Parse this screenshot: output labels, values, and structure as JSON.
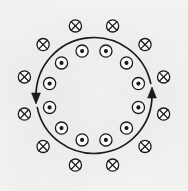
{
  "figure": {
    "title": "Circular current loop with magnetic field symbols",
    "width": 188,
    "height": 191,
    "background_color": "#fbfbfa",
    "ink_color": "#1a1a1a"
  },
  "loop": {
    "label": "current-loop",
    "center_x": 94,
    "center_y": 95.5,
    "radius": 58,
    "stroke_width": 1.7,
    "stroke_color": "#1a1a1a",
    "fill": "none",
    "direction": "counterclockwise",
    "gap_degrees": 6
  },
  "arrows": [
    {
      "name": "arrow-left-downward",
      "angle_degrees": 186,
      "points": "down",
      "tip_x": 36.0,
      "tip_y": 104.0,
      "size": 11
    },
    {
      "name": "arrow-right-upward",
      "angle_degrees": 6,
      "points": "up",
      "tip_x": 152.0,
      "tip_y": 87.0,
      "size": 11
    }
  ],
  "symbols": {
    "cross_symbol": {
      "glyph": "cross-in-circle",
      "meaning": "field into page",
      "count": 12,
      "orbit_radius": 72,
      "circle_radius": 6.1,
      "stroke_width": 1.3,
      "angle_offset_degrees": 15
    },
    "dot_symbol": {
      "glyph": "dot-in-circle",
      "meaning": "field out of page",
      "count": 12,
      "orbit_radius": 46,
      "circle_radius": 6.1,
      "inner_dot_radius": 2.05,
      "stroke_width": 1.3,
      "angle_offset_degrees": 15
    }
  },
  "cross_positions": [
    {
      "name": "cross-1",
      "angle": 15,
      "x": 163.6,
      "y": 76.9
    },
    {
      "name": "cross-2",
      "angle": 45,
      "x": 145.0,
      "y": 44.6
    },
    {
      "name": "cross-3",
      "angle": 75,
      "x": 112.6,
      "y": 25.9
    },
    {
      "name": "cross-4",
      "angle": 105,
      "x": 75.4,
      "y": 25.9
    },
    {
      "name": "cross-5",
      "angle": 135,
      "x": 43.1,
      "y": 44.6
    },
    {
      "name": "cross-6",
      "angle": 165,
      "x": 24.4,
      "y": 76.9
    },
    {
      "name": "cross-7",
      "angle": 195,
      "x": 24.4,
      "y": 114.1
    },
    {
      "name": "cross-8",
      "angle": 225,
      "x": 43.1,
      "y": 146.4
    },
    {
      "name": "cross-9",
      "angle": 255,
      "x": 75.4,
      "y": 165.1
    },
    {
      "name": "cross-10",
      "angle": 285,
      "x": 112.6,
      "y": 165.1
    },
    {
      "name": "cross-11",
      "angle": 315,
      "x": 145.0,
      "y": 146.4
    },
    {
      "name": "cross-12",
      "angle": 345,
      "x": 163.6,
      "y": 114.1
    }
  ],
  "dot_positions": [
    {
      "name": "dot-1",
      "angle": 15,
      "x": 138.4,
      "y": 83.6
    },
    {
      "name": "dot-2",
      "angle": 45,
      "x": 126.5,
      "y": 62.9
    },
    {
      "name": "dot-3",
      "angle": 75,
      "x": 105.9,
      "y": 51.1
    },
    {
      "name": "dot-4",
      "angle": 105,
      "x": 82.1,
      "y": 51.1
    },
    {
      "name": "dot-5",
      "angle": 135,
      "x": 61.5,
      "y": 62.9
    },
    {
      "name": "dot-6",
      "angle": 165,
      "x": 49.6,
      "y": 83.6
    },
    {
      "name": "dot-7",
      "angle": 195,
      "x": 49.6,
      "y": 107.4
    },
    {
      "name": "dot-8",
      "angle": 225,
      "x": 61.5,
      "y": 128.1
    },
    {
      "name": "dot-9",
      "angle": 255,
      "x": 82.1,
      "y": 139.9
    },
    {
      "name": "dot-10",
      "angle": 285,
      "x": 105.9,
      "y": 139.9
    },
    {
      "name": "dot-11",
      "angle": 315,
      "x": 126.5,
      "y": 128.1
    },
    {
      "name": "dot-12",
      "angle": 345,
      "x": 138.4,
      "y": 107.4
    }
  ]
}
